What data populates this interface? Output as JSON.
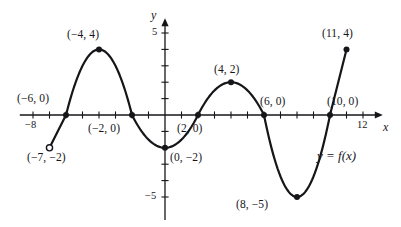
{
  "chart_data": {
    "type": "line",
    "title": "",
    "xlabel": "x",
    "ylabel": "y",
    "xlim": [
      -8.8,
      13.2
    ],
    "ylim": [
      -6.4,
      5.9
    ],
    "grid": false,
    "legend": "none",
    "curve_label": "y = f(x)",
    "x_tick_labels": [
      {
        "value": -8,
        "text": "−8"
      },
      {
        "value": 12,
        "text": "12"
      }
    ],
    "y_tick_labels": [
      {
        "value": 5,
        "text": "5"
      },
      {
        "value": -5,
        "text": "−5"
      }
    ],
    "x_ticks": [
      -8,
      -7,
      -6,
      -5,
      -4,
      -3,
      -2,
      -1,
      1,
      2,
      3,
      4,
      5,
      6,
      7,
      8,
      9,
      10,
      11,
      12
    ],
    "y_ticks": [
      5,
      4,
      3,
      2,
      1,
      -1,
      -2,
      -3,
      -4,
      -5
    ],
    "points": [
      {
        "x": -7,
        "y": -2,
        "label": "(−7, −2)",
        "marker": "open"
      },
      {
        "x": -6,
        "y": 0,
        "label": "(−6, 0)",
        "marker": "filled"
      },
      {
        "x": -4,
        "y": 4,
        "label": "(−4, 4)",
        "marker": "filled"
      },
      {
        "x": -2,
        "y": 0,
        "label": "(−2, 0)",
        "marker": "filled"
      },
      {
        "x": 0,
        "y": -2,
        "label": "(0, −2)",
        "marker": "filled"
      },
      {
        "x": 2,
        "y": 0,
        "label": "(2, 0)",
        "marker": "filled"
      },
      {
        "x": 4,
        "y": 2,
        "label": "(4, 2)",
        "marker": "filled"
      },
      {
        "x": 6,
        "y": 0,
        "label": "(6, 0)",
        "marker": "filled"
      },
      {
        "x": 8,
        "y": -5,
        "label": "(8, −5)",
        "marker": "filled"
      },
      {
        "x": 10,
        "y": 0,
        "label": "(10, 0)",
        "marker": "filled"
      },
      {
        "x": 11,
        "y": 4,
        "label": "(11, 4)",
        "marker": "filled"
      }
    ],
    "segments": [
      {
        "name": "linear-ramp",
        "from": [
          -7,
          -2
        ],
        "to": [
          -6,
          0
        ],
        "shape": "line"
      },
      {
        "name": "first-hill",
        "from": [
          -6,
          0
        ],
        "to": [
          -2,
          0
        ],
        "shape": "parabola-up",
        "vertex": [
          -4,
          4
        ]
      },
      {
        "name": "first-valley",
        "from": [
          -2,
          0
        ],
        "to": [
          2,
          0
        ],
        "shape": "parabola-down",
        "vertex": [
          0,
          -2
        ]
      },
      {
        "name": "second-hill",
        "from": [
          2,
          0
        ],
        "to": [
          6,
          0
        ],
        "shape": "parabola-up",
        "vertex": [
          4,
          2
        ]
      },
      {
        "name": "second-valley",
        "from": [
          6,
          0
        ],
        "to": [
          10,
          0
        ],
        "shape": "parabola-down",
        "vertex": [
          8,
          -5
        ]
      },
      {
        "name": "end-ramp",
        "from": [
          10,
          0
        ],
        "to": [
          11,
          4
        ],
        "shape": "line"
      }
    ],
    "colors": {
      "curve": "#16161a",
      "axis": "#16161a",
      "marker": "#16161a",
      "background": "#ffffff"
    }
  },
  "labels": {
    "y_axis_name": "y",
    "x_axis_name": "x"
  }
}
